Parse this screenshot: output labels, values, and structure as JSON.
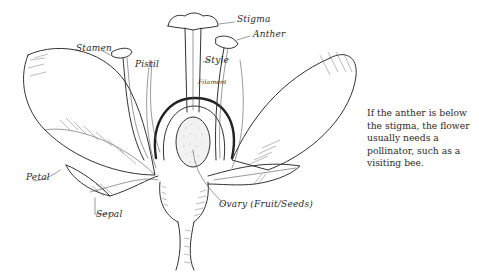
{
  "diagram": {
    "labels": {
      "stigma": "Stigma",
      "anther": "Anther",
      "stamen": "Stamen",
      "pistil": "Pistil",
      "style": "Style",
      "filament": "Filament",
      "petal": "Petal",
      "sepal": "Sepal",
      "ovary": "Ovary (Fruit/Seeds)"
    },
    "caption": "If the anther is below the stigma, the flower usually needs a pollinator, such as a visiting bee."
  },
  "colors": {
    "ink": "#333333",
    "background": "#ffffff",
    "ovule_fill": "#f2f2f2"
  }
}
